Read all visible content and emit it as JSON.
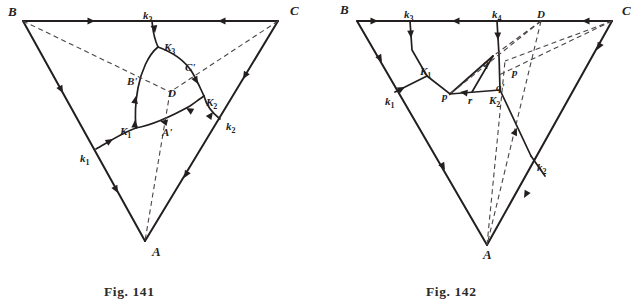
{
  "page": {
    "background": "#ffffff",
    "ink": "#241f1f",
    "dash_ink": "#4a4444",
    "width": 632,
    "height": 308
  },
  "captions": {
    "left": "Fig. 141",
    "right": "Fig. 142"
  },
  "figures": [
    {
      "id": "fig-141",
      "caption": "Fig. 141",
      "vertices": [
        {
          "name": "B",
          "label": "B",
          "x": 23,
          "y": 20,
          "lx": 8,
          "ly": 16
        },
        {
          "name": "C",
          "label": "C",
          "x": 278,
          "y": 20,
          "lx": 290,
          "ly": 15
        },
        {
          "name": "A",
          "label": "A",
          "x": 145,
          "y": 241,
          "lx": 152,
          "ly": 256
        }
      ],
      "labels": [
        {
          "name": "label-k3",
          "text": "k",
          "sub": "3",
          "x": 143,
          "y": 10
        },
        {
          "name": "label-K3",
          "text": "K",
          "sub": "3",
          "x": 164,
          "y": 42
        },
        {
          "name": "label-B-prime",
          "text": "B'",
          "sub": "",
          "x": 127,
          "y": 76
        },
        {
          "name": "label-C-prime",
          "text": "C'",
          "sub": "",
          "x": 185,
          "y": 62
        },
        {
          "name": "label-D",
          "text": "D",
          "sub": "",
          "x": 168,
          "y": 88
        },
        {
          "name": "label-K2",
          "text": "K",
          "sub": "2",
          "x": 206,
          "y": 97
        },
        {
          "name": "label-k2",
          "text": "k",
          "sub": "2",
          "x": 226,
          "y": 121
        },
        {
          "name": "label-K1",
          "text": "K",
          "sub": "1",
          "x": 120,
          "y": 126
        },
        {
          "name": "label-A-prime",
          "text": "A'",
          "sub": "",
          "x": 162,
          "y": 127
        },
        {
          "name": "label-k1",
          "text": "k",
          "sub": "1",
          "x": 80,
          "y": 153
        }
      ],
      "solid_edges": [
        {
          "name": "edge-BC",
          "d": "M 23 21 L 278 21"
        },
        {
          "name": "edge-BA",
          "d": "M 23 21 L 145 241"
        },
        {
          "name": "edge-CA",
          "d": "M 278 21 L 145 241"
        }
      ],
      "solid_curves": [
        {
          "name": "curve-k3-K3",
          "d": "M 152 21 C 153 30 153 36 158 47"
        },
        {
          "name": "curve-K3-B-prime-K1",
          "d": "M 158 47 C 148 55 141 72 138 88 C 135 104 135 118 136 128"
        },
        {
          "name": "curve-K3-C-prime-K2",
          "d": "M 158 47 C 172 52 185 61 192 72 C 198 82 201 90 204 96"
        },
        {
          "name": "curve-K2-k2",
          "d": "M 204 96 C 206 104 211 112 220 119"
        },
        {
          "name": "curve-K1-A-prime-K2",
          "d": "M 136 128 C 152 125 172 116 190 106 C 197 101 201 98 204 96"
        },
        {
          "name": "curve-K1-k1",
          "d": "M 136 128 C 124 132 110 141 96 149"
        }
      ],
      "dashed_lines": [
        {
          "name": "dash-B-D",
          "d": "M 23 21 L 170 92"
        },
        {
          "name": "dash-C-D",
          "d": "M 278 21 L 170 92"
        },
        {
          "name": "dash-D-A",
          "d": "M 170 92 L 145 241"
        }
      ],
      "arrows": [
        {
          "name": "arrow-BC-1",
          "x": 95,
          "y": 21,
          "angle": 0
        },
        {
          "name": "arrow-BC-2",
          "x": 218,
          "y": 21,
          "angle": 180
        },
        {
          "name": "arrow-BA-1",
          "x": 63,
          "y": 93,
          "angle": 61
        },
        {
          "name": "arrow-BA-2",
          "x": 118,
          "y": 193,
          "angle": 61
        },
        {
          "name": "arrow-CA-1",
          "x": 243,
          "y": 79,
          "angle": 121
        },
        {
          "name": "arrow-CA-2",
          "x": 184,
          "y": 178,
          "angle": 121
        },
        {
          "name": "arrow-k3-K3",
          "x": 155,
          "y": 33,
          "angle": 82
        },
        {
          "name": "arrow-B-branch-1",
          "x": 136,
          "y": 96,
          "angle": 281
        },
        {
          "name": "arrow-B-branch-2",
          "x": 135,
          "y": 120,
          "angle": 272
        },
        {
          "name": "arrow-C-branch",
          "x": 198,
          "y": 84,
          "angle": 61
        },
        {
          "name": "arrow-k2-up",
          "x": 213,
          "y": 112,
          "angle": 306
        },
        {
          "name": "arrow-A-branch-1",
          "x": 186,
          "y": 108,
          "angle": 210
        },
        {
          "name": "arrow-A-branch-2",
          "x": 160,
          "y": 121,
          "angle": 194
        },
        {
          "name": "arrow-k1-branch",
          "x": 113,
          "y": 139,
          "angle": 329
        }
      ]
    },
    {
      "id": "fig-142",
      "caption": "Fig. 142",
      "vertices": [
        {
          "name": "B",
          "label": "B",
          "x": 357,
          "y": 21,
          "lx": 340,
          "ly": 14
        },
        {
          "name": "C",
          "label": "C",
          "x": 612,
          "y": 21,
          "lx": 622,
          "ly": 15
        },
        {
          "name": "A",
          "label": "A",
          "x": 487,
          "y": 245,
          "lx": 483,
          "ly": 259
        }
      ],
      "labels": [
        {
          "name": "label-k3",
          "text": "k",
          "sub": "3",
          "x": 404,
          "y": 9
        },
        {
          "name": "label-k4",
          "text": "k",
          "sub": "4",
          "x": 492,
          "y": 9
        },
        {
          "name": "label-D",
          "text": "D",
          "sub": "",
          "x": 537,
          "y": 9
        },
        {
          "name": "label-q",
          "text": "q",
          "sub": "",
          "x": 483,
          "y": 58
        },
        {
          "name": "label-p",
          "text": "p",
          "sub": "",
          "x": 512,
          "y": 67
        },
        {
          "name": "label-K1",
          "text": "K",
          "sub": "1",
          "x": 420,
          "y": 66
        },
        {
          "name": "label-q-prime",
          "text": "q'",
          "sub": "",
          "x": 496,
          "y": 82
        },
        {
          "name": "label-p-prime",
          "text": "p'",
          "sub": "",
          "x": 442,
          "y": 91
        },
        {
          "name": "label-r",
          "text": "r",
          "sub": "",
          "x": 468,
          "y": 95
        },
        {
          "name": "label-K2",
          "text": "K",
          "sub": "2",
          "x": 489,
          "y": 95
        },
        {
          "name": "label-k1",
          "text": "k",
          "sub": "1",
          "x": 385,
          "y": 96
        },
        {
          "name": "label-k2",
          "text": "k",
          "sub": "2",
          "x": 537,
          "y": 162
        }
      ],
      "solid_edges": [
        {
          "name": "edge-BC",
          "d": "M 357 21 L 612 21"
        },
        {
          "name": "edge-BA",
          "d": "M 357 21 L 487 245"
        },
        {
          "name": "edge-CA",
          "d": "M 612 21 L 487 245"
        }
      ],
      "solid_curves": [
        {
          "name": "seg-k3-K1",
          "d": "M 410 21 L 412 50 L 427 76"
        },
        {
          "name": "seg-k4-K2",
          "d": "M 497 21 L 499 55 L 500 90"
        },
        {
          "name": "seg-K1-k1",
          "d": "M 427 76 L 395 92"
        },
        {
          "name": "seg-K1-p-prime-K2",
          "d": "M 427 76 L 450 94 L 500 90"
        },
        {
          "name": "seg-q-p-prime",
          "d": "M 493 56 L 450 94"
        },
        {
          "name": "seg-q-r",
          "d": "M 493 56 L 472 92"
        },
        {
          "name": "seg-K2-k2",
          "d": "M 500 90 L 531 156"
        },
        {
          "name": "seg-k2-down",
          "d": "M 531 156 L 545 176"
        }
      ],
      "dashed_lines": [
        {
          "name": "dash-D-q",
          "d": "M 541 21 L 493 56"
        },
        {
          "name": "dash-D-p-prime",
          "d": "M 541 21 L 450 94"
        },
        {
          "name": "dash-D-A",
          "d": "M 541 21 L 487 245"
        },
        {
          "name": "dash-C-p",
          "d": "M 612 21 L 505 61"
        },
        {
          "name": "dash-C-q-prime",
          "d": "M 612 21 L 497 76"
        },
        {
          "name": "dash-A-p",
          "d": "M 487 245 L 505 61"
        }
      ],
      "arrows": [
        {
          "name": "arrow-BC-1",
          "x": 378,
          "y": 21,
          "angle": 0
        },
        {
          "name": "arrow-BC-2",
          "x": 452,
          "y": 21,
          "angle": 180
        },
        {
          "name": "arrow-BC-3",
          "x": 582,
          "y": 21,
          "angle": 180
        },
        {
          "name": "arrow-BA-1",
          "x": 382,
          "y": 62,
          "angle": 60
        },
        {
          "name": "arrow-BA-2",
          "x": 445,
          "y": 170,
          "angle": 60
        },
        {
          "name": "arrow-CA-1",
          "x": 597,
          "y": 50,
          "angle": 119
        },
        {
          "name": "arrow-CA-2",
          "x": 524,
          "y": 198,
          "angle": 119
        },
        {
          "name": "arrow-k3-down",
          "x": 411,
          "y": 38,
          "angle": 87
        },
        {
          "name": "arrow-k4-down",
          "x": 498,
          "y": 40,
          "angle": 88
        },
        {
          "name": "arrow-k1-up",
          "x": 405,
          "y": 87,
          "angle": 333
        },
        {
          "name": "arrow-p-prime-left",
          "x": 460,
          "y": 92,
          "angle": 188
        },
        {
          "name": "arrow-K2-up",
          "x": 517,
          "y": 128,
          "angle": 295
        }
      ]
    }
  ]
}
